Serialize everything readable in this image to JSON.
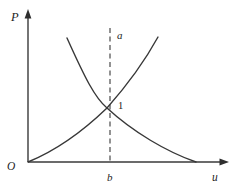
{
  "figure": {
    "type": "math-curve-diagram",
    "background_color": "#ffffff",
    "line_color": "#3a3a3a",
    "dashed_line_color": "#4a4a4a",
    "labels": {
      "y_axis": "P",
      "x_axis": "u",
      "origin": "O",
      "guide_top": "a",
      "guide_bottom": "b",
      "intersection_point": "1"
    },
    "axes": {
      "y_axis_arrow": "up",
      "x_axis_arrow": "right"
    },
    "guides": [
      {
        "name": "vertical-dashed-line",
        "style": "dashed",
        "top_label": "a",
        "bottom_label": "b",
        "passes_through": "intersection of the two curves"
      }
    ],
    "curves": [
      {
        "name": "decreasing-convex-curve",
        "shape": "falls steeply from upper left, flattens and meets the x-axis at lower right"
      },
      {
        "name": "increasing-convex-curve",
        "shape": "rises from the origin, steepens toward the upper right"
      }
    ]
  }
}
